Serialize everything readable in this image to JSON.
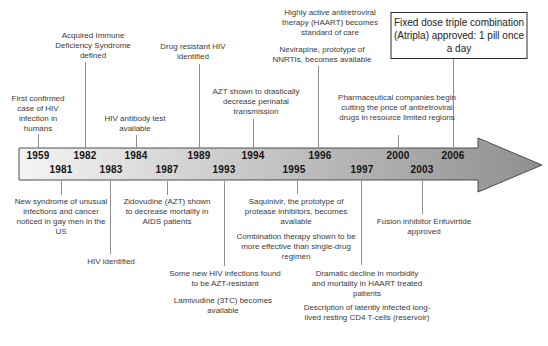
{
  "figure": {
    "type": "timeline",
    "colors": {
      "background": "#ffffff",
      "arrow_gradient_start": "#f4f4f4",
      "arrow_gradient_end": "#8f8f8f",
      "arrow_border": "#4d4d4d",
      "connector_line": "#8f8f8f",
      "note_text": "#3b3b3b",
      "year_text": "#141414",
      "highlight_box_border": "#2b2b2b"
    }
  },
  "timeline": {
    "years_top": [
      "1959",
      "1982",
      "1984",
      "1989",
      "1994",
      "1996",
      "2000",
      "2006"
    ],
    "years_bottom": [
      "1981",
      "1983",
      "1987",
      "1993",
      "1995",
      "1997",
      "2003"
    ]
  },
  "events_above": [
    {
      "year": "1959",
      "label": "First confirmed case of HIV infection in humans"
    },
    {
      "year": "1982",
      "label": "Acquired Immune Deficiency Syndrome defined"
    },
    {
      "year": "1984",
      "label": "HIV antibody test available"
    },
    {
      "year": "1989",
      "label": "Drug resistant HIV identified"
    },
    {
      "year": "1994",
      "label": "AZT shown to drastically decrease perinatal transmission"
    },
    {
      "year": "1996",
      "label": "Highly active antiretroviral therapy (HAART) becomes standard of care"
    },
    {
      "year": "1996",
      "label": "Nevirapine, prototype of NNRTIs, becomes available"
    },
    {
      "year": "2000",
      "label": "Pharmaceutical companies begin cutting the price of antiretroviral drugs in resource limited regions"
    },
    {
      "year": "2006",
      "label": "Fixed dose triple combination (Atripla) approved: 1 pill once a day",
      "highlighted_box": true
    }
  ],
  "events_below": [
    {
      "year": "1981",
      "label": "New syndrome of unusual infections and cancer noticed in gay men in the US"
    },
    {
      "year": "1983",
      "label": "HIV identified"
    },
    {
      "year": "1987",
      "label": "Zidovudine (AZT) shown to decrease mortality in AIDS patients"
    },
    {
      "year": "1993",
      "label": "Some new HIV infections found to be AZT-resistant"
    },
    {
      "year": "1993",
      "label": "Lamivudine (3TC) becomes available"
    },
    {
      "year": "1995",
      "label": "Saquinivir, the prototype of protease inhibitors, becomes available"
    },
    {
      "year": "1995",
      "label": "Combination therapy shown to be more effective than single-drug regimen"
    },
    {
      "year": "1997",
      "label": "Dramatic decline in morbidity and mortality in HAART treated patients"
    },
    {
      "year": "1997",
      "label": "Description of latently infected long-lived resting CD4 T-cells (reservoir)"
    },
    {
      "year": "2003",
      "label": "Fusion inhibitor Enfuvirtide approved"
    }
  ]
}
